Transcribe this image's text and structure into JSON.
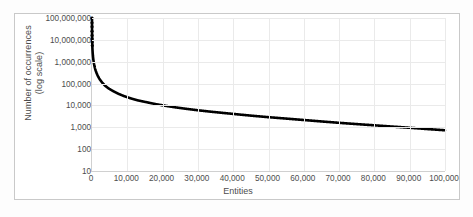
{
  "chart_data": {
    "type": "scatter",
    "title": "",
    "xlabel": "Entities",
    "ylabel": "Number of occurrences (log scale)",
    "ylabel_lines": [
      "Number of occurrences",
      "(log scale)"
    ],
    "xlim": [
      0,
      100000
    ],
    "ylim": [
      10,
      100000000
    ],
    "y_scale": "log",
    "grid": true,
    "legend": false,
    "marker_color": "#000000",
    "gridline_color": "#eaeaea",
    "axis_color": "#d0d0d0",
    "frame_color": "#c9c9c9",
    "background_color": "#ffffff",
    "label_color": "#4d4d4d",
    "x_ticks": [
      {
        "value": 0,
        "label": "0"
      },
      {
        "value": 10000,
        "label": "10,000"
      },
      {
        "value": 20000,
        "label": "20,000"
      },
      {
        "value": 30000,
        "label": "30,000"
      },
      {
        "value": 40000,
        "label": "40,000"
      },
      {
        "value": 50000,
        "label": "50,000"
      },
      {
        "value": 60000,
        "label": "60,000"
      },
      {
        "value": 70000,
        "label": "70,000"
      },
      {
        "value": 80000,
        "label": "80,000"
      },
      {
        "value": 90000,
        "label": "90,000"
      },
      {
        "value": 100000,
        "label": "100,000"
      }
    ],
    "y_ticks": [
      {
        "value": 10,
        "label": "10"
      },
      {
        "value": 100,
        "label": "100"
      },
      {
        "value": 1000,
        "label": "1,000"
      },
      {
        "value": 10000,
        "label": "10,000"
      },
      {
        "value": 100000,
        "label": "100,000"
      },
      {
        "value": 1000000,
        "label": "1,000,000"
      },
      {
        "value": 10000000,
        "label": "10,000,000"
      },
      {
        "value": 100000000,
        "label": "100,000,000"
      }
    ],
    "series": [
      {
        "name": "occurrences",
        "points": [
          [
            1,
            100000000
          ],
          [
            3,
            60000000
          ],
          [
            8,
            40000000
          ],
          [
            15,
            25000000
          ],
          [
            25,
            16000000
          ],
          [
            40,
            11000000
          ],
          [
            60,
            8000000
          ],
          [
            90,
            5500000
          ],
          [
            130,
            3800000
          ],
          [
            190,
            2600000
          ],
          [
            270,
            1800000
          ],
          [
            380,
            1250000
          ],
          [
            520,
            880000
          ],
          [
            700,
            620000
          ],
          [
            950,
            430000
          ],
          [
            1300,
            300000
          ],
          [
            1700,
            215000
          ],
          [
            2200,
            155000
          ],
          [
            2900,
            110000
          ],
          [
            3700,
            80000
          ],
          [
            4700,
            60000
          ],
          [
            6000,
            45000
          ],
          [
            7500,
            34000
          ],
          [
            9000,
            27000
          ],
          [
            11000,
            21000
          ],
          [
            13000,
            17000
          ],
          [
            15500,
            14000
          ],
          [
            18000,
            11500
          ],
          [
            21000,
            9500
          ],
          [
            24000,
            8000
          ],
          [
            27000,
            6900
          ],
          [
            30000,
            6000
          ],
          [
            34000,
            5100
          ],
          [
            38000,
            4400
          ],
          [
            42000,
            3800
          ],
          [
            46000,
            3300
          ],
          [
            50000,
            2900
          ],
          [
            55000,
            2500
          ],
          [
            60000,
            2150
          ],
          [
            65000,
            1850
          ],
          [
            70000,
            1600
          ],
          [
            75000,
            1400
          ],
          [
            80000,
            1230
          ],
          [
            85000,
            1080
          ],
          [
            90000,
            950
          ],
          [
            95000,
            830
          ],
          [
            100000,
            730
          ]
        ]
      }
    ]
  }
}
